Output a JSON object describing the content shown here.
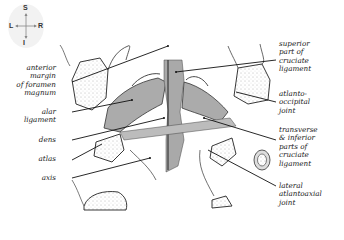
{
  "orientation": {
    "superior": "S",
    "inferior": "I",
    "left": "L",
    "right": "R"
  },
  "labels_left": [
    {
      "id": "anterior-margin-foramen-magnum",
      "lines": [
        "anterior",
        "margin",
        "of foramen",
        "magnum"
      ]
    },
    {
      "id": "alar-ligament",
      "lines": [
        "alar",
        "ligament"
      ]
    },
    {
      "id": "dens",
      "lines": [
        "dens"
      ]
    },
    {
      "id": "atlas",
      "lines": [
        "atlas"
      ]
    },
    {
      "id": "axis",
      "lines": [
        "axis"
      ]
    }
  ],
  "labels_right": [
    {
      "id": "superior-cruciate",
      "lines": [
        "superior",
        "part of",
        "cruciate",
        "ligament"
      ]
    },
    {
      "id": "atlanto-occipital-joint",
      "lines": [
        "atlanto-",
        "occipital",
        "joint"
      ]
    },
    {
      "id": "transverse-inferior-cruciate",
      "lines": [
        "transverse",
        "& inferior",
        "parts of",
        "cruciate",
        "ligament"
      ]
    },
    {
      "id": "lateral-atlantoaxial-joint",
      "lines": [
        "lateral",
        "atlantoaxial",
        "joint"
      ]
    }
  ],
  "colors": {
    "ligament_gray": "#a9a9a9",
    "bone_outline": "#222222",
    "stipple": "#e6e6e6"
  }
}
